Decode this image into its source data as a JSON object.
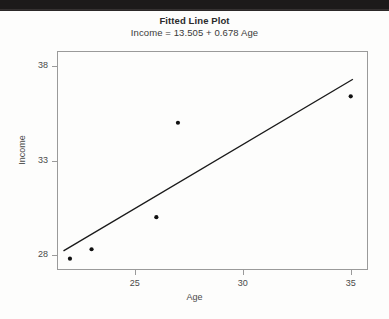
{
  "figure": {
    "title": "Fitted Line Plot",
    "subtitle": "Income = 13.505 + 0.678 Age",
    "x_axis_label": "Age",
    "y_axis_label": "Income",
    "point_color": "#111111",
    "line_color": "#1a1a1a",
    "frame_color": "#9a9a9a",
    "background_color": "#fdfdfc"
  },
  "chart_data": {
    "type": "scatter",
    "title": "Fitted Line Plot",
    "subtitle": "Income = 13.505 + 0.678 Age",
    "xlabel": "Age",
    "ylabel": "Income",
    "xlim": [
      21.4,
      35.8
    ],
    "ylim": [
      27.2,
      38.8
    ],
    "xticks": [
      25,
      30,
      35
    ],
    "xtick_labels": [
      "25",
      "30",
      "35"
    ],
    "yticks": [
      28,
      33,
      38
    ],
    "ytick_labels": [
      "28",
      "33",
      "38"
    ],
    "grid": false,
    "legend": false,
    "x": [
      22,
      23,
      26,
      27,
      35
    ],
    "y": [
      27.8,
      28.3,
      30.0,
      35.0,
      36.4
    ],
    "points": [
      {
        "age": 22,
        "income": 27.8
      },
      {
        "age": 23,
        "income": 28.3
      },
      {
        "age": 26,
        "income": 30.0
      },
      {
        "age": 27,
        "income": 35.0
      },
      {
        "age": 35,
        "income": 36.4
      }
    ],
    "fit_line": {
      "equation": "Income = 13.505 + 0.678 Age",
      "intercept": 13.505,
      "slope": 0.678,
      "x_start": 21.7,
      "x_end": 35.1
    }
  }
}
